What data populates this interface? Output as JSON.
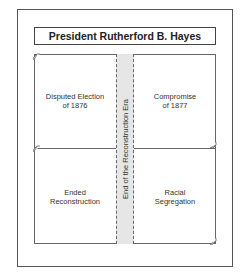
{
  "title": "President Rutherford B. Hayes",
  "center_band": {
    "label": "End of the Reconstruction Era"
  },
  "quadrants": [
    {
      "lines": [
        "Disputed Election",
        "of 1876"
      ]
    },
    {
      "lines": [
        "Compromise",
        "of 1877"
      ]
    },
    {
      "lines": [
        "Ended",
        "Reconstruction"
      ]
    },
    {
      "lines": [
        "Racial",
        "Segregation"
      ]
    }
  ],
  "colors": {
    "band_fill": "#e6e6e6",
    "border": "#555555"
  }
}
